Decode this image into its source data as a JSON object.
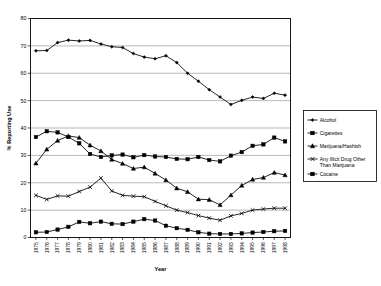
{
  "chart_data": {
    "type": "line",
    "title": "",
    "xlabel": "Year",
    "ylabel": "% Reporting Use",
    "ylim": [
      0,
      80
    ],
    "ytick_values": [
      0,
      10,
      20,
      30,
      40,
      50,
      60,
      70,
      80
    ],
    "ytick_labels": [
      "0",
      "10",
      "20",
      "30",
      "40",
      "50",
      "60",
      "70",
      "80"
    ],
    "grid": true,
    "grid_axis": "y",
    "legend_position": "right",
    "categories": [
      "1975",
      "1976",
      "1977",
      "1978",
      "1979",
      "1980",
      "1981",
      "1982",
      "1983",
      "1984",
      "1985",
      "1986",
      "1987",
      "1988",
      "1989",
      "1990",
      "1991",
      "1992",
      "1993",
      "1994",
      "1995",
      "1996",
      "1997",
      "1998"
    ],
    "series": [
      {
        "name": "Alcohol",
        "marker": "diamond",
        "values": [
          68.2,
          68.3,
          71.2,
          72.1,
          71.8,
          72.0,
          70.7,
          69.7,
          69.4,
          67.2,
          65.9,
          65.3,
          66.4,
          63.9,
          60.0,
          57.1,
          54.0,
          51.3,
          48.6,
          50.1,
          51.3,
          50.8,
          52.7,
          52.0
        ]
      },
      {
        "name": "Cigarettes",
        "marker": "square",
        "values": [
          36.7,
          38.8,
          38.4,
          36.7,
          34.4,
          30.5,
          29.4,
          30.0,
          30.3,
          29.3,
          30.1,
          29.6,
          29.4,
          28.7,
          28.6,
          29.4,
          28.3,
          27.8,
          29.9,
          31.2,
          33.5,
          34.0,
          36.5,
          35.1
        ]
      },
      {
        "name": "Marijuana/Hashish",
        "marker": "triangle",
        "values": [
          27.1,
          32.2,
          35.4,
          37.1,
          36.5,
          33.7,
          31.6,
          28.5,
          27.0,
          25.2,
          25.7,
          23.4,
          21.0,
          18.0,
          16.7,
          14.0,
          13.8,
          11.9,
          15.5,
          19.0,
          21.2,
          21.9,
          23.7,
          22.8
        ]
      },
      {
        "name": "Any Illicit Drug Other Than Marijuana",
        "marker": "x",
        "values": [
          15.4,
          13.9,
          15.2,
          15.1,
          16.8,
          18.4,
          21.7,
          17.0,
          15.4,
          15.1,
          14.9,
          13.2,
          11.6,
          10.0,
          9.1,
          8.0,
          7.1,
          6.3,
          7.9,
          8.8,
          10.0,
          10.4,
          10.7,
          10.7
        ]
      },
      {
        "name": "Cocaine",
        "marker": "square",
        "values": [
          1.9,
          2.0,
          2.9,
          3.9,
          5.7,
          5.2,
          5.8,
          5.0,
          4.9,
          5.8,
          6.7,
          6.2,
          4.3,
          3.4,
          2.8,
          1.9,
          1.4,
          1.3,
          1.3,
          1.5,
          1.8,
          2.0,
          2.3,
          2.4
        ]
      }
    ],
    "legend_entries": [
      "Alcohol",
      "Cigarettes",
      "Marijuana/Hashish",
      "Any Illicit Drug Other",
      "Than Marijuana",
      "Cocaine"
    ]
  }
}
